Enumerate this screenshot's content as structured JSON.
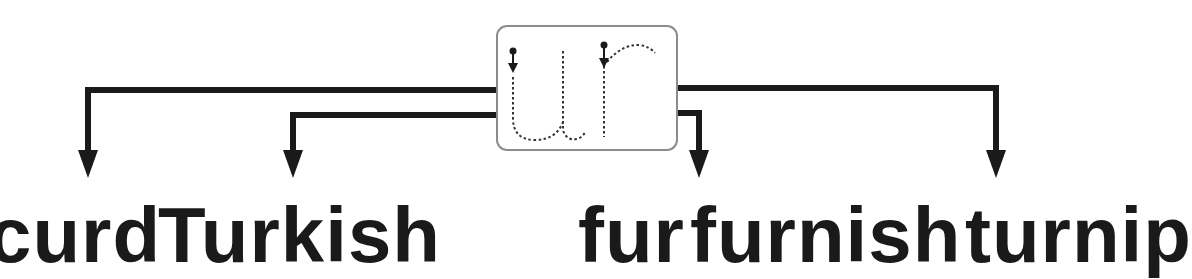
{
  "card": {
    "letters": "ur",
    "description": "Dotted tracing guide for the letters u and r with start dots and direction arrows",
    "border_color": "#8c8c8c"
  },
  "connectors": {
    "line_color": "#1a1a1a",
    "arrows": [
      {
        "id": "arrow-1",
        "x": 88
      },
      {
        "id": "arrow-2",
        "x": 293
      },
      {
        "id": "arrow-3",
        "x": 699
      },
      {
        "id": "arrow-4",
        "x": 996
      }
    ]
  },
  "words": [
    {
      "text": "curd",
      "x": 40
    },
    {
      "text": "Turkish",
      "x": 195
    },
    {
      "text": "fur",
      "x": 578
    },
    {
      "text": "furnish",
      "x": 640
    },
    {
      "text": "turnip",
      "x": 900
    }
  ]
}
